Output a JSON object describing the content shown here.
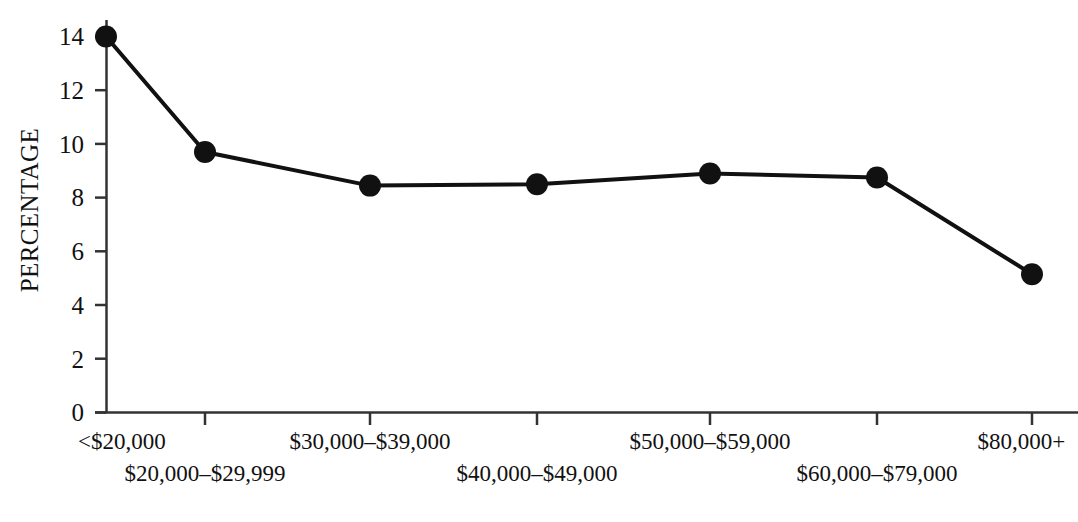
{
  "chart_data": {
    "type": "line",
    "title": "",
    "subtitle": "",
    "xlabel": "",
    "ylabel": "PERCENTAGE",
    "categories": [
      "<$20,000",
      "$20,000–$29,999",
      "$30,000–$39,000",
      "$40,000–$49,000",
      "$50,000–$59,000",
      "$60,000–$79,000",
      "$80,000+"
    ],
    "values": [
      14.0,
      9.7,
      8.45,
      8.5,
      8.9,
      8.75,
      5.15
    ],
    "ylim": [
      0,
      14
    ],
    "ytick_labels": [
      "0",
      "2",
      "4",
      "6",
      "8",
      "10",
      "12",
      "14"
    ],
    "ytick_values": [
      0,
      2,
      4,
      6,
      8,
      10,
      12,
      14
    ],
    "grid": false,
    "legend": "none",
    "marker": "filled-circle",
    "line_color": "#111111",
    "marker_color": "#111111",
    "axis_color": "#333333",
    "background_color": "#ffffff",
    "x_label_rows": [
      {
        "row": 1,
        "indices": [
          0,
          2,
          4,
          6
        ]
      },
      {
        "row": 2,
        "indices": [
          1,
          3,
          5
        ]
      }
    ]
  }
}
